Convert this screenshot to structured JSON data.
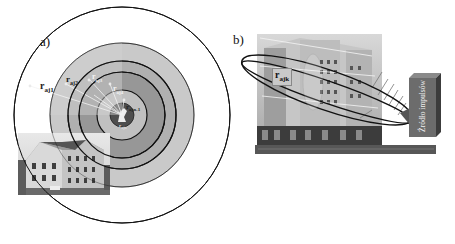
{
  "panel_a": {
    "label": "a)",
    "radii_labels": [
      "r",
      "aj1",
      "aj2",
      "aj3",
      "aj4",
      "ajn-1",
      "ajn"
    ],
    "r1_base": "r",
    "r1_sub": "aj1",
    "r2_base": "r",
    "r2_sub": "aj2",
    "r3_base": "r",
    "r3_sub": "aj3",
    "r4_base": "r",
    "r4_sub": "aj4",
    "rn1_base": "r",
    "rn1_sub": "ajn-1",
    "rn_base": "r",
    "rn_sub": "ajn",
    "colors": {
      "ring_outer_light": "#c8c8c8",
      "ring_mid": "#a9a9a9",
      "ring_dark": "#8e8e8e",
      "ring_inner_light": "#bdbdbd",
      "center_dark": "#5a5a5a",
      "line": "#111111"
    }
  },
  "panel_b": {
    "label": "b)",
    "rajk_base": "r",
    "rajk_sub": "ajk",
    "source_box_label": "Źródło impulsów",
    "colors": {
      "box_front": "#6e6e6e",
      "box_side": "#4a4a4a",
      "ground": "#555555",
      "building": "#b9b9b9"
    }
  }
}
